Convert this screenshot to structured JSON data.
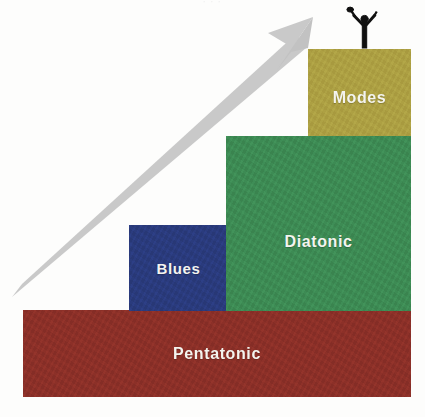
{
  "diagram": {
    "type": "staircase-progression",
    "background_color": "#fdfdfc",
    "top_cropped_text": "· · ·",
    "blocks": [
      {
        "id": "pentatonic",
        "label": "Pentatonic",
        "color": "#8C3028",
        "order": 1,
        "x": 23,
        "y": 310,
        "width": 388,
        "height": 87
      },
      {
        "id": "blues",
        "label": "Blues",
        "color": "#2A3B7D",
        "order": 2,
        "x": 129,
        "y": 225,
        "width": 99,
        "height": 86
      },
      {
        "id": "diatonic",
        "label": "Diatonic",
        "color": "#3D8B54",
        "order": 3,
        "x": 226,
        "y": 136,
        "width": 185,
        "height": 175
      },
      {
        "id": "modes",
        "label": "Modes",
        "color": "#ADA043",
        "order": 4,
        "x": 308,
        "y": 49,
        "width": 103,
        "height": 87
      }
    ],
    "arrow": {
      "name": "growth-arrow",
      "color": "#C9C9C9",
      "direction": "up-right",
      "start_x": 16,
      "start_y": 292,
      "tip_x": 312,
      "tip_y": 18
    },
    "figure": {
      "name": "celebrating-stick-figure",
      "color": "#101010",
      "description": "stick figure with both arms raised standing on the Modes block"
    }
  }
}
